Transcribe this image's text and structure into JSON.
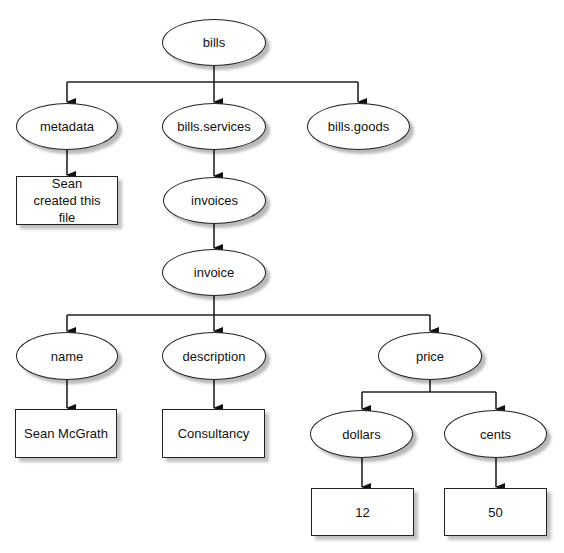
{
  "diagram": {
    "type": "tree",
    "nodes": [
      {
        "id": "bills",
        "label": "bills",
        "shape": "ellipse",
        "x": 162,
        "y": 19,
        "w": 104,
        "h": 47
      },
      {
        "id": "metadata",
        "label": "metadata",
        "shape": "ellipse",
        "x": 16,
        "y": 103,
        "w": 102,
        "h": 47
      },
      {
        "id": "bills_services",
        "label": "bills.services",
        "shape": "ellipse",
        "x": 162,
        "y": 103,
        "w": 104,
        "h": 47
      },
      {
        "id": "bills_goods",
        "label": "bills.goods",
        "shape": "ellipse",
        "x": 307,
        "y": 103,
        "w": 103,
        "h": 47
      },
      {
        "id": "metadata_value",
        "label": "Sean created this file",
        "shape": "rect",
        "x": 16,
        "y": 176,
        "w": 102,
        "h": 49
      },
      {
        "id": "invoices",
        "label": "invoices",
        "shape": "ellipse",
        "x": 163,
        "y": 177,
        "w": 103,
        "h": 47
      },
      {
        "id": "invoice",
        "label": "invoice",
        "shape": "ellipse",
        "x": 162,
        "y": 249,
        "w": 104,
        "h": 47
      },
      {
        "id": "name",
        "label": "name",
        "shape": "ellipse",
        "x": 16,
        "y": 332,
        "w": 102,
        "h": 48
      },
      {
        "id": "description",
        "label": "description",
        "shape": "ellipse",
        "x": 162,
        "y": 332,
        "w": 104,
        "h": 48
      },
      {
        "id": "price",
        "label": "price",
        "shape": "ellipse",
        "x": 378,
        "y": 332,
        "w": 104,
        "h": 48
      },
      {
        "id": "name_value",
        "label": "Sean McGrath",
        "shape": "rect",
        "x": 15,
        "y": 409,
        "w": 102,
        "h": 49
      },
      {
        "id": "description_value",
        "label": "Consultancy",
        "shape": "rect",
        "x": 162,
        "y": 409,
        "w": 103,
        "h": 49
      },
      {
        "id": "dollars",
        "label": "dollars",
        "shape": "ellipse",
        "x": 310,
        "y": 410,
        "w": 103,
        "h": 48
      },
      {
        "id": "cents",
        "label": "cents",
        "shape": "ellipse",
        "x": 444,
        "y": 410,
        "w": 103,
        "h": 48
      },
      {
        "id": "dollars_value",
        "label": "12",
        "shape": "rect",
        "x": 311,
        "y": 488,
        "w": 103,
        "h": 48
      },
      {
        "id": "cents_value",
        "label": "50",
        "shape": "rect",
        "x": 444,
        "y": 488,
        "w": 103,
        "h": 48
      }
    ],
    "edges": [
      {
        "from": "bills",
        "to": "metadata"
      },
      {
        "from": "bills",
        "to": "bills_services"
      },
      {
        "from": "bills",
        "to": "bills_goods"
      },
      {
        "from": "metadata",
        "to": "metadata_value"
      },
      {
        "from": "bills_services",
        "to": "invoices"
      },
      {
        "from": "invoices",
        "to": "invoice"
      },
      {
        "from": "invoice",
        "to": "name"
      },
      {
        "from": "invoice",
        "to": "description"
      },
      {
        "from": "invoice",
        "to": "price"
      },
      {
        "from": "name",
        "to": "name_value"
      },
      {
        "from": "description",
        "to": "description_value"
      },
      {
        "from": "price",
        "to": "dollars"
      },
      {
        "from": "price",
        "to": "cents"
      },
      {
        "from": "dollars",
        "to": "dollars_value"
      },
      {
        "from": "cents",
        "to": "cents_value"
      }
    ],
    "colors": {
      "stroke": "#222222",
      "fill": "#ffffff",
      "shadow": "#b5b5b5"
    }
  }
}
